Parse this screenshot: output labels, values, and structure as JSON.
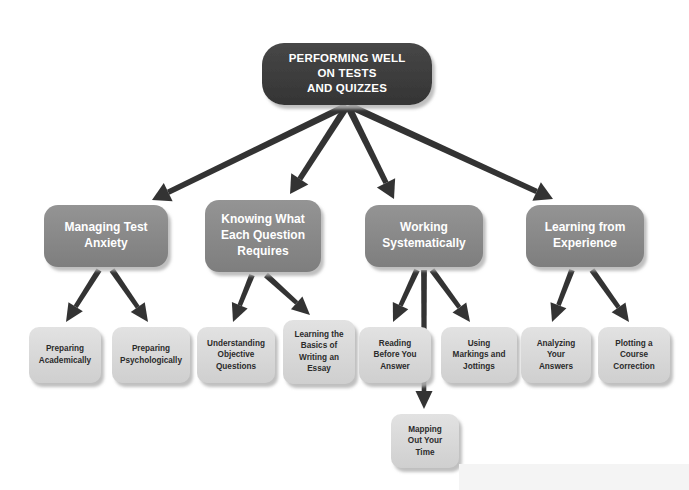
{
  "canvas": {
    "width": 689,
    "height": 490,
    "background": "#ffffff"
  },
  "colors": {
    "root_fill": "#3d3d3d",
    "branch_fill": "#8a8a8a",
    "leaf_fill": "#d9d9d9",
    "connector": "#333333",
    "root_text": "#ffffff",
    "branch_text": "#ffffff",
    "leaf_text": "#2b2b2b",
    "shadow": "#c9c9c9"
  },
  "diagram": {
    "type": "tree",
    "root": {
      "id": "root",
      "lines": [
        "PERFORMING WELL",
        "ON TESTS",
        "AND QUIZZES"
      ],
      "x": 262,
      "y": 43,
      "w": 170,
      "h": 62,
      "r": 22,
      "level": "root"
    },
    "branches": [
      {
        "id": "branch-managing-test-anxiety",
        "lines": [
          "Managing Test",
          "Anxiety"
        ],
        "x": 44,
        "y": 205,
        "w": 124,
        "h": 62,
        "r": 14,
        "level": "branch"
      },
      {
        "id": "branch-knowing-what-each-question-requires",
        "lines": [
          "Knowing What",
          "Each Question",
          "Requires"
        ],
        "x": 205,
        "y": 200,
        "w": 116,
        "h": 72,
        "r": 14,
        "level": "branch"
      },
      {
        "id": "branch-working-systematically",
        "lines": [
          "Working",
          "Systematically"
        ],
        "x": 365,
        "y": 205,
        "w": 118,
        "h": 62,
        "r": 14,
        "level": "branch"
      },
      {
        "id": "branch-learning-from-experience",
        "lines": [
          "Learning from",
          "Experience"
        ],
        "x": 526,
        "y": 205,
        "w": 118,
        "h": 62,
        "r": 14,
        "level": "branch"
      }
    ],
    "leaves": [
      {
        "id": "leaf-preparing-academically",
        "lines": [
          "Preparing",
          "Academically"
        ],
        "x": 29,
        "y": 327,
        "w": 72,
        "h": 56,
        "r": 10,
        "parent": "branch-managing-test-anxiety",
        "level": "leaf"
      },
      {
        "id": "leaf-preparing-psychologically",
        "lines": [
          "Preparing",
          "Psychologically"
        ],
        "x": 112,
        "y": 327,
        "w": 78,
        "h": 56,
        "r": 10,
        "parent": "branch-managing-test-anxiety",
        "level": "leaf"
      },
      {
        "id": "leaf-understanding-objective-questions",
        "lines": [
          "Understanding",
          "Objective",
          "Questions"
        ],
        "x": 197,
        "y": 327,
        "w": 78,
        "h": 56,
        "r": 10,
        "parent": "branch-knowing-what-each-question-requires",
        "level": "leaf"
      },
      {
        "id": "leaf-learning-basics-writing-essay",
        "lines": [
          "Learning the",
          "Basics of",
          "Writing an",
          "Essay"
        ],
        "x": 283,
        "y": 320,
        "w": 72,
        "h": 64,
        "r": 10,
        "parent": "branch-knowing-what-each-question-requires",
        "level": "leaf"
      },
      {
        "id": "leaf-reading-before-you-answer",
        "lines": [
          "Reading",
          "Before You",
          "Answer"
        ],
        "x": 359,
        "y": 327,
        "w": 72,
        "h": 56,
        "r": 10,
        "parent": "branch-working-systematically",
        "level": "leaf"
      },
      {
        "id": "leaf-using-markings-and-jottings",
        "lines": [
          "Using",
          "Markings and",
          "Jottings"
        ],
        "x": 441,
        "y": 327,
        "w": 76,
        "h": 56,
        "r": 10,
        "parent": "branch-working-systematically",
        "level": "leaf"
      },
      {
        "id": "leaf-analyzing-your-answers",
        "lines": [
          "Analyzing",
          "Your",
          "Answers"
        ],
        "x": 521,
        "y": 327,
        "w": 70,
        "h": 56,
        "r": 10,
        "parent": "branch-learning-from-experience",
        "level": "leaf"
      },
      {
        "id": "leaf-plotting-a-course-correction",
        "lines": [
          "Plotting a",
          "Course",
          "Correction"
        ],
        "x": 598,
        "y": 327,
        "w": 72,
        "h": 56,
        "r": 10,
        "parent": "branch-learning-from-experience",
        "level": "leaf"
      },
      {
        "id": "leaf-mapping-out-your-time",
        "lines": [
          "Mapping",
          "Out Your",
          "Time"
        ],
        "x": 391,
        "y": 414,
        "w": 68,
        "h": 54,
        "r": 10,
        "parent": "branch-working-systematically",
        "level": "leaf"
      }
    ],
    "connectors": [
      {
        "id": "conn-root-to-managing-test-anxiety",
        "from": "root",
        "to": "branch-managing-test-anxiety",
        "x1": 346,
        "y1": 106,
        "x2": 152,
        "y2": 200,
        "width": 5.5
      },
      {
        "id": "conn-root-to-knowing-what",
        "from": "root",
        "to": "branch-knowing-what-each-question-requires",
        "x1": 347,
        "y1": 106,
        "x2": 290,
        "y2": 194,
        "width": 5.5
      },
      {
        "id": "conn-root-to-working-systematically",
        "from": "root",
        "to": "branch-working-systematically",
        "x1": 348,
        "y1": 106,
        "x2": 394,
        "y2": 199,
        "width": 5.5
      },
      {
        "id": "conn-root-to-learning-from-experience",
        "from": "root",
        "to": "branch-learning-from-experience",
        "x1": 350,
        "y1": 106,
        "x2": 553,
        "y2": 199,
        "width": 5.5
      },
      {
        "id": "conn-managing-to-preparing-academically",
        "from": "branch-managing-test-anxiety",
        "to": "leaf-preparing-academically",
        "x1": 99,
        "y1": 270,
        "x2": 66,
        "y2": 322,
        "width": 4.6
      },
      {
        "id": "conn-managing-to-preparing-psychologically",
        "from": "branch-managing-test-anxiety",
        "to": "leaf-preparing-psychologically",
        "x1": 112,
        "y1": 270,
        "x2": 148,
        "y2": 322,
        "width": 4.6
      },
      {
        "id": "conn-knowing-to-understanding-objective",
        "from": "branch-knowing-what-each-question-requires",
        "to": "leaf-understanding-objective-questions",
        "x1": 252,
        "y1": 275,
        "x2": 233,
        "y2": 322,
        "width": 4.6
      },
      {
        "id": "conn-knowing-to-learning-basics",
        "from": "branch-knowing-what-each-question-requires",
        "to": "leaf-learning-basics-writing-essay",
        "x1": 266,
        "y1": 275,
        "x2": 310,
        "y2": 315,
        "width": 4.6
      },
      {
        "id": "conn-working-to-reading-before",
        "from": "branch-working-systematically",
        "to": "leaf-reading-before-you-answer",
        "x1": 417,
        "y1": 270,
        "x2": 393,
        "y2": 322,
        "width": 4.6
      },
      {
        "id": "conn-working-to-using-markings",
        "from": "branch-working-systematically",
        "to": "leaf-using-markings-and-jottings",
        "x1": 432,
        "y1": 270,
        "x2": 470,
        "y2": 322,
        "width": 4.6
      },
      {
        "id": "conn-working-to-mapping-out-your-time",
        "from": "branch-working-systematically",
        "to": "leaf-mapping-out-your-time",
        "x1": 424,
        "y1": 270,
        "x2": 424,
        "y2": 409,
        "width": 4.6
      },
      {
        "id": "conn-learning-to-analyzing-your-answers",
        "from": "branch-learning-from-experience",
        "to": "leaf-analyzing-your-answers",
        "x1": 572,
        "y1": 270,
        "x2": 552,
        "y2": 322,
        "width": 4.6
      },
      {
        "id": "conn-learning-to-plotting-course",
        "from": "branch-learning-from-experience",
        "to": "leaf-plotting-a-course-correction",
        "x1": 592,
        "y1": 270,
        "x2": 629,
        "y2": 322,
        "width": 4.6
      }
    ]
  }
}
